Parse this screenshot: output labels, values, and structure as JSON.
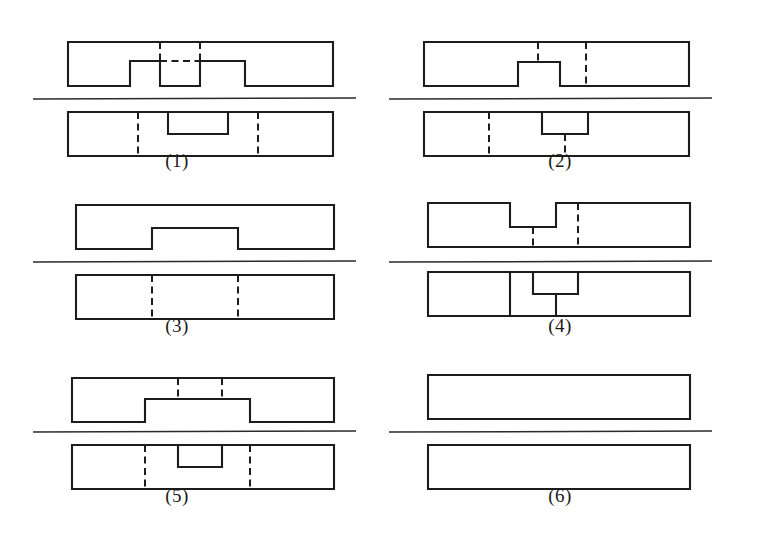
{
  "page": {
    "background_color": "#ffffff",
    "line_color": "#1c1c1c",
    "width": 763,
    "height": 554
  },
  "figures": [
    {
      "id": "figure-1",
      "label": "(1)",
      "label_x": 177,
      "label_y": 160,
      "column": "left",
      "row": 1,
      "origin_x": 68,
      "origin_y": 42,
      "separator": {
        "x1": 33,
        "y1": 99,
        "x2": 356,
        "y2": 98
      },
      "top_view": {
        "name": "front-view",
        "x": 68,
        "y": 42,
        "w": 265,
        "h": 44,
        "outline": "M68,42 L333,42 L333,86 L245,86 L245,61 L200,61 L200,86 L160,86 L160,61 L130,61 L130,86 L68,86 Z",
        "hidden_lines": [
          "M160,42 L160,61",
          "M200,42 L200,61",
          "M160,61 L200,61"
        ]
      },
      "bottom_view": {
        "name": "top-view",
        "x": 68,
        "y": 112,
        "w": 265,
        "h": 44,
        "outline": "M68,112 L333,112 L333,156 L68,156 Z",
        "visible_lines": [
          "M168,112 L168,134 L228,134 L228,112"
        ],
        "hidden_lines": [
          "M138,112 L138,156",
          "M258,112 L258,156"
        ]
      }
    },
    {
      "id": "figure-2",
      "label": "(2)",
      "label_x": 560,
      "label_y": 160,
      "column": "right",
      "row": 1,
      "origin_x": 424,
      "origin_y": 42,
      "separator": {
        "x1": 389,
        "y1": 99,
        "x2": 712,
        "y2": 98
      },
      "top_view": {
        "name": "front-view",
        "x": 424,
        "y": 42,
        "w": 265,
        "h": 44,
        "outline": "M424,42 L689,42 L689,86 L560,86 L560,62 L518,62 L518,86 L424,86 Z",
        "hidden_lines": [
          "M538,42 L538,62",
          "M586,42 L586,86"
        ]
      },
      "bottom_view": {
        "name": "top-view",
        "x": 424,
        "y": 112,
        "w": 265,
        "h": 44,
        "outline": "M424,112 L689,112 L689,156 L424,156 Z",
        "visible_lines": [
          "M542,112 L542,134 L588,134 L588,112"
        ],
        "hidden_lines": [
          "M489,112 L489,156",
          "M565,134 L565,156"
        ]
      }
    },
    {
      "id": "figure-3",
      "label": "(3)",
      "label_x": 177,
      "label_y": 325,
      "column": "left",
      "row": 2,
      "origin_x": 76,
      "origin_y": 205,
      "separator": {
        "x1": 33,
        "y1": 262,
        "x2": 356,
        "y2": 261
      },
      "top_view": {
        "name": "front-view",
        "x": 76,
        "y": 205,
        "w": 258,
        "h": 44,
        "outline": "M76,205 L334,205 L334,249 L238,249 L238,228 L152,228 L152,249 L76,249 Z",
        "hidden_lines": []
      },
      "bottom_view": {
        "name": "top-view",
        "x": 76,
        "y": 275,
        "w": 258,
        "h": 44,
        "outline": "M76,275 L334,275 L334,319 L76,319 Z",
        "visible_lines": [],
        "hidden_lines": [
          "M152,275 L152,319",
          "M238,275 L238,319"
        ]
      }
    },
    {
      "id": "figure-4",
      "label": "(4)",
      "label_x": 560,
      "label_y": 325,
      "column": "right",
      "row": 2,
      "origin_x": 428,
      "origin_y": 203,
      "separator": {
        "x1": 389,
        "y1": 262,
        "x2": 712,
        "y2": 261
      },
      "top_view": {
        "name": "front-view",
        "x": 428,
        "y": 203,
        "w": 262,
        "h": 44,
        "outline": "M428,203 L690,203 L690,247 L556,247 L556,227 L510,227 L510,203 L428,203 M428,203 L428,247 L556,247",
        "outline_closed": "M428,203 L510,203 L510,227 L556,227 L556,203 L690,203 L690,247 L428,247 Z",
        "hidden_lines": [
          "M533,227 L533,247",
          "M578,203 L578,247"
        ]
      },
      "bottom_view": {
        "name": "top-view",
        "x": 428,
        "y": 272,
        "w": 262,
        "h": 44,
        "outline": "M428,272 L690,272 L690,316 L428,316 Z",
        "visible_lines": [
          "M510,272 L510,316",
          "M533,272 L533,294",
          "M533,294 L578,294",
          "M578,272 L578,294",
          "M556,294 L556,316"
        ],
        "hidden_lines": []
      }
    },
    {
      "id": "figure-5",
      "label": "(5)",
      "label_x": 177,
      "label_y": 495,
      "column": "left",
      "row": 3,
      "origin_x": 72,
      "origin_y": 378,
      "separator": {
        "x1": 33,
        "y1": 432,
        "x2": 356,
        "y2": 431
      },
      "top_view": {
        "name": "front-view",
        "x": 72,
        "y": 378,
        "w": 262,
        "h": 44,
        "outline": "M72,378 L334,378 L334,422 L250,422 L250,399 L145,399 L145,422 L72,422 Z",
        "hidden_lines": [
          "M178,378 L178,399",
          "M222,378 L222,399"
        ]
      },
      "bottom_view": {
        "name": "top-view",
        "x": 72,
        "y": 445,
        "w": 262,
        "h": 44,
        "outline": "M72,445 L334,445 L334,489 L72,489 Z",
        "visible_lines": [
          "M178,445 L178,467 L222,467 L222,445"
        ],
        "hidden_lines": [
          "M145,445 L145,489",
          "M250,445 L250,489"
        ]
      }
    },
    {
      "id": "figure-6",
      "label": "(6)",
      "label_x": 560,
      "label_y": 495,
      "column": "right",
      "row": 3,
      "origin_x": 428,
      "origin_y": 375,
      "separator": {
        "x1": 389,
        "y1": 432,
        "x2": 712,
        "y2": 431
      },
      "top_view": {
        "name": "front-view",
        "x": 428,
        "y": 375,
        "w": 262,
        "h": 44,
        "outline": "M428,375 L690,375 L690,419 L428,419 Z",
        "hidden_lines": []
      },
      "bottom_view": {
        "name": "top-view",
        "x": 428,
        "y": 445,
        "w": 262,
        "h": 44,
        "outline": "M428,445 L690,445 L690,489 L428,489 Z",
        "visible_lines": [],
        "hidden_lines": []
      }
    }
  ]
}
